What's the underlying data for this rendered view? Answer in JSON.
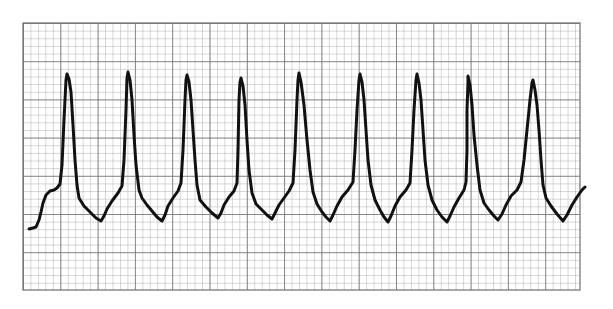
{
  "chart_data": {
    "type": "line",
    "title": "ECG rhythm strip",
    "xlabel": "",
    "ylabel": "",
    "grid": true,
    "legend": null,
    "paper": {
      "x0": 23,
      "y0": 23,
      "x1": 580,
      "y1": 290,
      "major_box_px_x": 37.3,
      "major_box_px_y": 38.2,
      "minor_per_major": 5,
      "major_boxes_x": 14.9,
      "major_boxes_y": 7,
      "background": "#ffffff",
      "minor_line_color": "#a8a8a8",
      "major_line_color": "#6e6e6e"
    },
    "trace_color": "#111111",
    "beat_count": 9,
    "peaks_px": [
      [
        67,
        74
      ],
      [
        128,
        72
      ],
      [
        186,
        75
      ],
      [
        240,
        78
      ],
      [
        299,
        73
      ],
      [
        360,
        74
      ],
      [
        417,
        74
      ],
      [
        468,
        76
      ],
      [
        533,
        80
      ]
    ],
    "troughs_px": [
      [
        101,
        221
      ],
      [
        162,
        221
      ],
      [
        218,
        218
      ],
      [
        272,
        219
      ],
      [
        330,
        221
      ],
      [
        388,
        222
      ],
      [
        447,
        222
      ],
      [
        498,
        220
      ],
      [
        563,
        221
      ]
    ],
    "rr_interval_px_approx": 58,
    "points_px": [
      [
        29,
        229
      ],
      [
        33,
        228
      ],
      [
        36,
        227
      ],
      [
        39,
        220
      ],
      [
        41,
        212
      ],
      [
        43,
        203
      ],
      [
        46,
        195
      ],
      [
        50,
        191
      ],
      [
        54,
        190
      ],
      [
        57,
        188
      ],
      [
        60,
        184
      ],
      [
        62,
        165
      ],
      [
        64,
        120
      ],
      [
        66,
        80
      ],
      [
        67,
        74
      ],
      [
        69,
        79
      ],
      [
        71,
        92
      ],
      [
        73,
        125
      ],
      [
        75,
        160
      ],
      [
        77,
        185
      ],
      [
        79,
        198
      ],
      [
        84,
        206
      ],
      [
        90,
        212
      ],
      [
        96,
        218
      ],
      [
        101,
        221
      ],
      [
        104,
        216
      ],
      [
        107,
        209
      ],
      [
        112,
        201
      ],
      [
        118,
        193
      ],
      [
        122,
        186
      ],
      [
        124,
        160
      ],
      [
        126,
        110
      ],
      [
        127,
        78
      ],
      [
        128,
        72
      ],
      [
        130,
        80
      ],
      [
        132,
        100
      ],
      [
        134,
        135
      ],
      [
        136,
        165
      ],
      [
        139,
        190
      ],
      [
        142,
        198
      ],
      [
        147,
        205
      ],
      [
        152,
        211
      ],
      [
        157,
        217
      ],
      [
        162,
        221
      ],
      [
        165,
        215
      ],
      [
        168,
        206
      ],
      [
        173,
        198
      ],
      [
        178,
        191
      ],
      [
        181,
        183
      ],
      [
        183,
        150
      ],
      [
        185,
        100
      ],
      [
        186,
        80
      ],
      [
        187,
        75
      ],
      [
        189,
        82
      ],
      [
        191,
        100
      ],
      [
        193,
        130
      ],
      [
        195,
        160
      ],
      [
        197,
        185
      ],
      [
        200,
        200
      ],
      [
        206,
        207
      ],
      [
        212,
        213
      ],
      [
        218,
        218
      ],
      [
        221,
        213
      ],
      [
        224,
        205
      ],
      [
        229,
        197
      ],
      [
        234,
        191
      ],
      [
        237,
        183
      ],
      [
        238,
        150
      ],
      [
        239,
        100
      ],
      [
        240,
        82
      ],
      [
        241,
        78
      ],
      [
        243,
        86
      ],
      [
        245,
        105
      ],
      [
        247,
        140
      ],
      [
        249,
        170
      ],
      [
        252,
        193
      ],
      [
        256,
        204
      ],
      [
        262,
        210
      ],
      [
        267,
        215
      ],
      [
        272,
        219
      ],
      [
        275,
        213
      ],
      [
        279,
        205
      ],
      [
        284,
        198
      ],
      [
        289,
        191
      ],
      [
        293,
        183
      ],
      [
        295,
        150
      ],
      [
        297,
        100
      ],
      [
        298,
        80
      ],
      [
        299,
        73
      ],
      [
        301,
        82
      ],
      [
        304,
        105
      ],
      [
        307,
        140
      ],
      [
        310,
        170
      ],
      [
        313,
        192
      ],
      [
        317,
        204
      ],
      [
        322,
        212
      ],
      [
        326,
        217
      ],
      [
        330,
        221
      ],
      [
        333,
        215
      ],
      [
        337,
        206
      ],
      [
        342,
        197
      ],
      [
        348,
        190
      ],
      [
        353,
        182
      ],
      [
        355,
        150
      ],
      [
        357,
        110
      ],
      [
        359,
        80
      ],
      [
        360,
        74
      ],
      [
        362,
        82
      ],
      [
        364,
        100
      ],
      [
        366,
        130
      ],
      [
        368,
        160
      ],
      [
        371,
        185
      ],
      [
        375,
        200
      ],
      [
        380,
        210
      ],
      [
        384,
        217
      ],
      [
        388,
        222
      ],
      [
        391,
        216
      ],
      [
        395,
        206
      ],
      [
        400,
        197
      ],
      [
        406,
        190
      ],
      [
        410,
        183
      ],
      [
        412,
        150
      ],
      [
        414,
        110
      ],
      [
        416,
        80
      ],
      [
        417,
        74
      ],
      [
        419,
        83
      ],
      [
        421,
        100
      ],
      [
        423,
        130
      ],
      [
        425,
        160
      ],
      [
        428,
        185
      ],
      [
        432,
        200
      ],
      [
        437,
        210
      ],
      [
        442,
        217
      ],
      [
        447,
        222
      ],
      [
        450,
        216
      ],
      [
        454,
        207
      ],
      [
        459,
        198
      ],
      [
        464,
        190
      ],
      [
        466,
        182
      ],
      [
        467,
        150
      ],
      [
        467,
        110
      ],
      [
        468,
        82
      ],
      [
        468,
        76
      ],
      [
        470,
        85
      ],
      [
        472,
        105
      ],
      [
        474,
        135
      ],
      [
        477,
        165
      ],
      [
        480,
        190
      ],
      [
        484,
        203
      ],
      [
        489,
        210
      ],
      [
        494,
        216
      ],
      [
        498,
        220
      ],
      [
        502,
        214
      ],
      [
        506,
        205
      ],
      [
        511,
        196
      ],
      [
        517,
        190
      ],
      [
        521,
        182
      ],
      [
        524,
        160
      ],
      [
        527,
        130
      ],
      [
        530,
        100
      ],
      [
        532,
        83
      ],
      [
        533,
        80
      ],
      [
        535,
        90
      ],
      [
        537,
        105
      ],
      [
        539,
        130
      ],
      [
        541,
        160
      ],
      [
        543,
        185
      ],
      [
        546,
        198
      ],
      [
        551,
        206
      ],
      [
        557,
        214
      ],
      [
        563,
        221
      ],
      [
        567,
        215
      ],
      [
        572,
        205
      ],
      [
        577,
        197
      ],
      [
        582,
        190
      ],
      [
        585,
        187
      ]
    ]
  }
}
